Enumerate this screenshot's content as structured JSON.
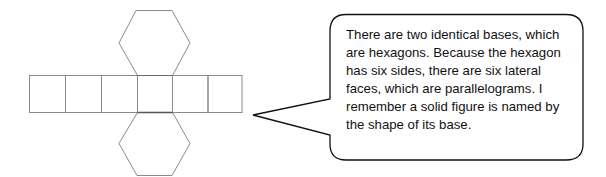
{
  "figure": {
    "net": {
      "lateral_faces": 6,
      "bases": 2,
      "base_shape": "hexagon",
      "stroke_color": "#8a8a8a",
      "highlight_stroke_color": "#555555"
    },
    "speech_bubble": {
      "stroke_color": "#111111",
      "lines": [
        "There are two identical bases, which",
        "are hexagons.  Because the hexagon",
        "has six sides, there are six lateral",
        "faces, which are parallelograms.  I",
        "remember a solid figure is named by",
        "the shape of its base."
      ]
    }
  }
}
